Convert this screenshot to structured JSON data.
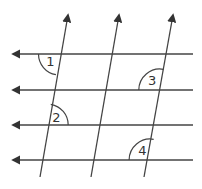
{
  "diagram": {
    "colors": {
      "line": "#444444",
      "background": "#ffffff",
      "label": "#333333"
    },
    "horizontal_lines": [
      {
        "y": 54,
        "x_start": 193,
        "x_end": 13,
        "direction": "left"
      },
      {
        "y": 90,
        "x_start": 193,
        "x_end": 13,
        "direction": "left"
      },
      {
        "y": 125,
        "x_start": 193,
        "x_end": 13,
        "direction": "left"
      },
      {
        "y": 160,
        "x_start": 193,
        "x_end": 13,
        "direction": "left"
      }
    ],
    "transversals": [
      {
        "x1": 40,
        "y1": 177,
        "x2": 68,
        "y2": 15,
        "direction": "up"
      },
      {
        "x1": 91,
        "y1": 177,
        "x2": 119,
        "y2": 15,
        "direction": "up"
      },
      {
        "x1": 144,
        "y1": 177,
        "x2": 173,
        "y2": 15,
        "direction": "up"
      }
    ],
    "angles": [
      {
        "label": "1",
        "cx": 59.5,
        "cy": 54,
        "quadrant": "lower-left"
      },
      {
        "label": "2",
        "cx": 47.2,
        "cy": 125,
        "quadrant": "upper-right"
      },
      {
        "label": "3",
        "cx": 159.8,
        "cy": 90,
        "quadrant": "upper-left"
      },
      {
        "label": "4",
        "cx": 150.1,
        "cy": 160,
        "quadrant": "upper-left"
      }
    ]
  }
}
